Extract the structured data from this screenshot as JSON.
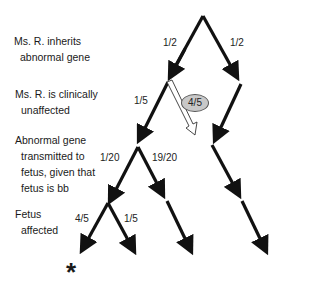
{
  "levels": [
    {
      "line1": "Ms. R. inherits",
      "line2": "abnormal gene"
    },
    {
      "line1": "Ms. R. is clinically",
      "line2": "unaffected"
    },
    {
      "line1": "Abnormal gene",
      "line2": "transmitted to",
      "line3": "fetus, given that",
      "line4": "fetus is bb"
    },
    {
      "line1": "Fetus",
      "line2": "affected"
    }
  ],
  "probabilities": {
    "inherit_yes": "1/2",
    "inherit_no": "1/2",
    "unaffected_yes": "1/5",
    "unaffected_no_highlighted": "4/5",
    "transmit_yes": "1/20",
    "transmit_no": "19/20",
    "affected_yes": "4/5",
    "affected_no": "1/5"
  },
  "marker": "*"
}
